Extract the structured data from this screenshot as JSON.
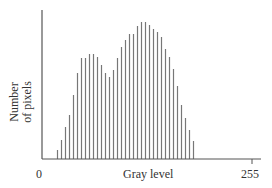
{
  "chart_data": {
    "type": "bar",
    "title": "",
    "xlabel": "Gray level",
    "ylabel": "Number of pixels",
    "ylabel_lines": [
      "Number",
      "of pixels"
    ],
    "x_ticks": [
      {
        "label": "0",
        "value": 0
      },
      {
        "label": "255",
        "value": 255
      }
    ],
    "xlim": [
      0,
      255
    ],
    "grid": false,
    "legend": null,
    "bar_style": "thin vertical lines (histogram spikes)",
    "bar_color": "#777777",
    "axis_color": "#555555",
    "note": "Bimodal gray-level histogram; heights in relative units (0-138, pixel-based estimate), no y tick values shown",
    "x": [
      12,
      16,
      20,
      24,
      28,
      32,
      36,
      40,
      44,
      48,
      52,
      56,
      60,
      64,
      68,
      72,
      76,
      80,
      84,
      88,
      92,
      96,
      100,
      104,
      108,
      112,
      116,
      120,
      124,
      128,
      132,
      136,
      140,
      144,
      148
    ],
    "values": [
      9,
      19,
      32,
      44,
      64,
      86,
      101,
      101,
      105,
      105,
      102,
      94,
      86,
      82,
      89,
      101,
      112,
      119,
      125,
      125,
      133,
      137,
      137,
      134,
      130,
      127,
      122,
      110,
      102,
      90,
      73,
      54,
      41,
      29,
      18
    ]
  },
  "layout": {
    "origin_px": [
      42,
      159
    ],
    "x_axis_end_px": 261,
    "y_axis_top_px": 10,
    "x255_px": 252,
    "first_bar_px": 57,
    "bar_spacing_px": 4,
    "value_to_px": 1
  }
}
